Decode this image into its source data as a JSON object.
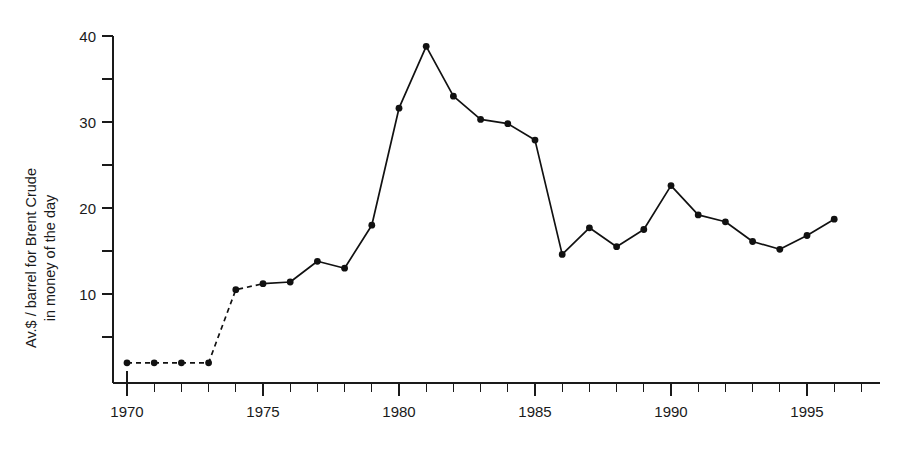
{
  "chart_data": {
    "type": "line",
    "title": "",
    "subtitle": "",
    "xlabel": "",
    "ylabel": "Av.$ / barrel for Brent Crude in money of the day",
    "ylabel_lines": [
      "Av.$ / barrel for Brent Crude",
      "in money of the day"
    ],
    "xlim": [
      1969.4,
      1998.0
    ],
    "ylim": [
      0,
      41.5
    ],
    "grid": false,
    "legend": null,
    "legend_position": "none",
    "x_tick_labels": [
      "1970",
      "1975",
      "1980",
      "1985",
      "1990",
      "1995"
    ],
    "x_tick_values": [
      1970,
      1975,
      1980,
      1985,
      1990,
      1995
    ],
    "x_minor_tick_interval": 1,
    "y_tick_labels": [
      "10",
      "20",
      "30",
      "40"
    ],
    "y_tick_values": [
      10,
      20,
      30,
      40
    ],
    "y_minor_tick_values": [
      5,
      15,
      25,
      35
    ],
    "series": [
      {
        "name": "Brent Crude average price",
        "color": "#111111",
        "marker": "filled-circle",
        "x": [
          1970,
          1971,
          1972,
          1973,
          1974,
          1975,
          1976,
          1977,
          1978,
          1979,
          1980,
          1981,
          1982,
          1983,
          1984,
          1985,
          1986,
          1987,
          1988,
          1989,
          1990,
          1991,
          1992,
          1993,
          1994,
          1995,
          1996
        ],
        "values": [
          2.0,
          2.0,
          2.0,
          2.0,
          10.5,
          11.2,
          11.4,
          13.8,
          13.0,
          18.0,
          31.6,
          38.8,
          33.0,
          30.3,
          29.8,
          27.9,
          14.6,
          17.7,
          15.5,
          17.5,
          22.6,
          19.2,
          18.4,
          16.1,
          15.2,
          16.8,
          18.7
        ],
        "dashed_until_x": 1975
      }
    ],
    "annotations": []
  },
  "figure": {
    "background_color": "#ffffff",
    "axis_color": "#1a1a1a",
    "series_color": "#111111"
  }
}
